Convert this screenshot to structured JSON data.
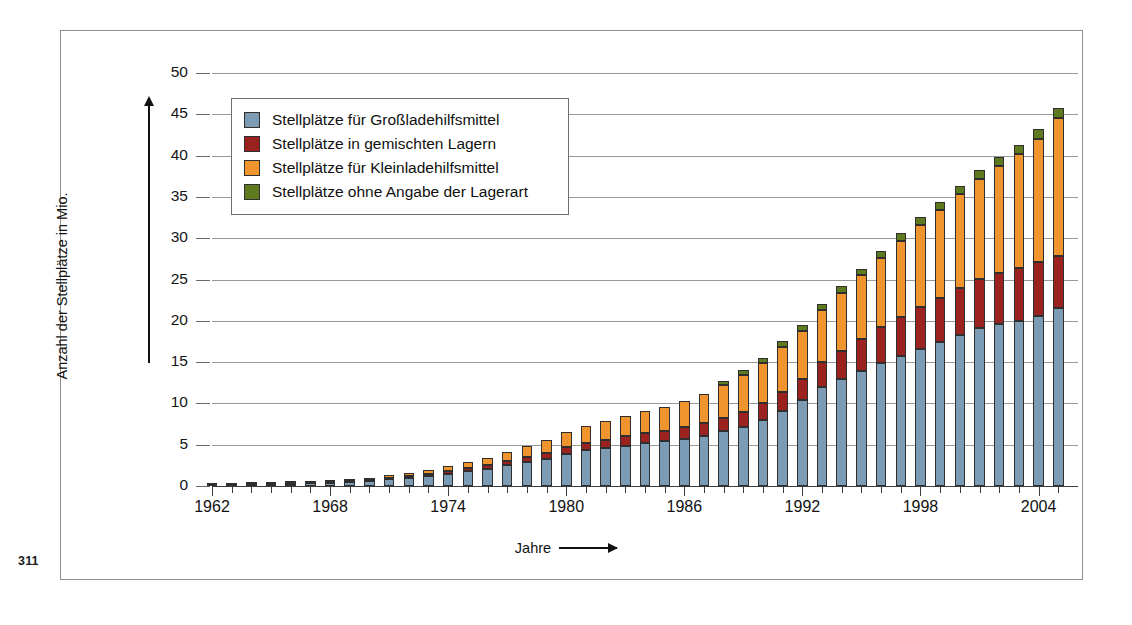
{
  "page": {
    "number": "311"
  },
  "chart_data": {
    "type": "bar",
    "subtype": "stacked-bar",
    "title": "",
    "xlabel": "Jahre",
    "ylabel": "Anzahl der Stellplätze in Mio.",
    "ylim": [
      0,
      50
    ],
    "ytick_values": [
      0,
      5,
      10,
      15,
      20,
      25,
      30,
      35,
      40,
      45,
      50
    ],
    "ytick_labels": [
      "0",
      "5",
      "10",
      "15",
      "20",
      "25",
      "30",
      "35",
      "40",
      "45",
      "50"
    ],
    "grid": true,
    "legend_position": "upper-left-inside",
    "x_tick_label_years": [
      "1962",
      "1968",
      "1974",
      "1980",
      "1986",
      "1992",
      "1998",
      "2004"
    ],
    "categories": [
      "1962",
      "1963",
      "1964",
      "1965",
      "1966",
      "1967",
      "1968",
      "1969",
      "1970",
      "1971",
      "1972",
      "1973",
      "1974",
      "1975",
      "1976",
      "1977",
      "1978",
      "1979",
      "1980",
      "1981",
      "1982",
      "1983",
      "1984",
      "1985",
      "1986",
      "1987",
      "1988",
      "1989",
      "1990",
      "1991",
      "1992",
      "1993",
      "1994",
      "1995",
      "1996",
      "1997",
      "1998",
      "1999",
      "2000",
      "2001",
      "2002",
      "2003",
      "2004",
      "2005"
    ],
    "series": [
      {
        "name": "Stellplätze für Großladehilfsmittel",
        "color": "#7c9bb5",
        "values": [
          0.12,
          0.15,
          0.18,
          0.22,
          0.26,
          0.32,
          0.4,
          0.5,
          0.62,
          0.85,
          1.0,
          1.25,
          1.5,
          1.8,
          2.1,
          2.5,
          2.9,
          3.3,
          3.9,
          4.3,
          4.6,
          4.9,
          5.2,
          5.4,
          5.7,
          6.1,
          6.6,
          7.2,
          8.0,
          9.1,
          10.4,
          12.0,
          12.9,
          13.9,
          14.9,
          15.8,
          16.6,
          17.4,
          18.3,
          19.1,
          19.6,
          20.0,
          20.6,
          21.6
        ]
      },
      {
        "name": "Stellplätze in gemischten Lagern",
        "color": "#9c2220",
        "values": [
          0.03,
          0.03,
          0.04,
          0.05,
          0.06,
          0.07,
          0.09,
          0.11,
          0.13,
          0.17,
          0.2,
          0.25,
          0.3,
          0.35,
          0.4,
          0.5,
          0.6,
          0.7,
          0.8,
          0.9,
          1.0,
          1.1,
          1.2,
          1.3,
          1.4,
          1.5,
          1.6,
          1.8,
          2.0,
          2.3,
          2.6,
          3.0,
          3.5,
          3.9,
          4.3,
          4.7,
          5.1,
          5.4,
          5.7,
          6.0,
          6.2,
          6.4,
          6.5,
          6.3
        ]
      },
      {
        "name": "Stellplätze für Kleinladehilfsmittel",
        "color": "#f0942e",
        "values": [
          0.02,
          0.02,
          0.03,
          0.03,
          0.04,
          0.05,
          0.06,
          0.09,
          0.15,
          0.28,
          0.4,
          0.5,
          0.6,
          0.75,
          0.9,
          1.1,
          1.3,
          1.6,
          1.9,
          2.1,
          2.3,
          2.5,
          2.7,
          2.9,
          3.2,
          3.6,
          4.0,
          4.4,
          4.9,
          5.4,
          5.8,
          6.3,
          7.0,
          7.7,
          8.4,
          9.2,
          9.9,
          10.6,
          11.3,
          12.1,
          12.9,
          13.8,
          14.9,
          16.6
        ]
      },
      {
        "name": "Stellplätze ohne Angabe der Lagerart",
        "color": "#5e7a1e",
        "values": [
          0,
          0,
          0,
          0,
          0,
          0,
          0,
          0,
          0,
          0,
          0,
          0,
          0,
          0,
          0,
          0,
          0,
          0,
          0,
          0,
          0,
          0,
          0,
          0,
          0,
          0,
          0.5,
          0.6,
          0.6,
          0.7,
          0.7,
          0.7,
          0.8,
          0.8,
          0.9,
          0.9,
          1.0,
          1.0,
          1.0,
          1.1,
          1.1,
          1.1,
          1.2,
          1.3
        ]
      }
    ]
  },
  "legend": {
    "items": [
      {
        "label": "Stellplätze für Großladehilfsmittel",
        "color": "#7c9bb5"
      },
      {
        "label": "Stellplätze in gemischten Lagern",
        "color": "#9c2220"
      },
      {
        "label": "Stellplätze für Kleinladehilfsmittel",
        "color": "#f0942e"
      },
      {
        "label": "Stellplätze ohne Angabe der Lagerart",
        "color": "#5e7a1e"
      }
    ]
  }
}
